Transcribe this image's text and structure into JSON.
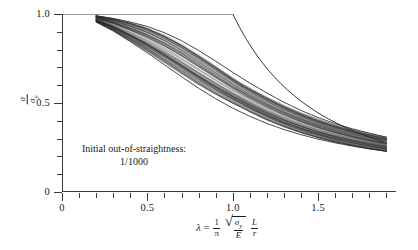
{
  "figure": {
    "background": "#ffffff",
    "axis_color": "#3a3a3a",
    "curve_color": "#2b2b2b",
    "annotation": {
      "line1": "Initial out-of-straightness:",
      "line2": "1/1000"
    },
    "ylabel_parts": {
      "numerator": "σ",
      "denominator": "σ",
      "denominator_sub": "y"
    },
    "xlabel_parts": {
      "lambda": "λ",
      "equals": "=",
      "one": "1",
      "pi": "π",
      "sigma_y": "σ",
      "sigma_y_sub": "y",
      "E": "E",
      "L": "L",
      "r": "r"
    }
  },
  "chart_data": {
    "type": "line",
    "title": "",
    "subtitle": "",
    "xlabel": "λ = (1/π)√(σ_y/E)(L/r)",
    "ylabel": "σ/σ_y",
    "xlim": [
      0,
      1.95
    ],
    "ylim": [
      0,
      1.0
    ],
    "grid": false,
    "legend": null,
    "annotations": [
      {
        "text": "Initial out-of-straightness: 1/1000",
        "x": 0.4,
        "y": 0.28
      }
    ],
    "xticks_major": [
      0,
      0.5,
      1.0,
      1.5
    ],
    "xticks_major_labels": [
      "0",
      "0.5",
      "1.0",
      "1.5"
    ],
    "xtick_minor_step": 0.1,
    "yticks_major": [
      0,
      0.5,
      1.0
    ],
    "yticks_major_labels": [
      "0",
      "0.5",
      "1.0"
    ],
    "ytick_minor_step": 0.1,
    "series": [
      {
        "name": "Euler / yield envelope",
        "role": "theoretical-upper-bound",
        "x": [
          0.0,
          0.2,
          0.4,
          0.6,
          0.8,
          1.0,
          1.1,
          1.2,
          1.3,
          1.4,
          1.5,
          1.6,
          1.7,
          1.8,
          1.9
        ],
        "values": [
          1.0,
          1.0,
          1.0,
          1.0,
          1.0,
          1.0,
          0.826,
          0.694,
          0.592,
          0.51,
          0.444,
          0.391,
          0.346,
          0.309,
          0.277
        ]
      },
      {
        "name": "upper bound column curve",
        "role": "band-upper",
        "x": [
          0.2,
          0.3,
          0.4,
          0.5,
          0.6,
          0.7,
          0.8,
          0.9,
          1.0,
          1.1,
          1.2,
          1.3,
          1.4,
          1.5,
          1.6,
          1.7,
          1.8,
          1.9
        ],
        "values": [
          0.99,
          0.975,
          0.955,
          0.93,
          0.895,
          0.85,
          0.795,
          0.735,
          0.672,
          0.612,
          0.556,
          0.504,
          0.458,
          0.418,
          0.384,
          0.355,
          0.33,
          0.308
        ]
      },
      {
        "name": "column curve band (upper-mid)",
        "role": "band",
        "x": [
          0.2,
          0.3,
          0.4,
          0.5,
          0.6,
          0.7,
          0.8,
          0.9,
          1.0,
          1.1,
          1.2,
          1.3,
          1.4,
          1.5,
          1.6,
          1.7,
          1.8,
          1.9
        ],
        "values": [
          0.985,
          0.962,
          0.932,
          0.896,
          0.852,
          0.8,
          0.742,
          0.681,
          0.62,
          0.562,
          0.51,
          0.463,
          0.422,
          0.387,
          0.357,
          0.331,
          0.309,
          0.29
        ]
      },
      {
        "name": "column curve band (mid)",
        "role": "band",
        "x": [
          0.2,
          0.3,
          0.4,
          0.5,
          0.6,
          0.7,
          0.8,
          0.9,
          1.0,
          1.1,
          1.2,
          1.3,
          1.4,
          1.5,
          1.6,
          1.7,
          1.8,
          1.9
        ],
        "values": [
          0.978,
          0.948,
          0.908,
          0.862,
          0.81,
          0.752,
          0.69,
          0.628,
          0.57,
          0.516,
          0.468,
          0.426,
          0.389,
          0.358,
          0.331,
          0.308,
          0.288,
          0.271
        ]
      },
      {
        "name": "column curve band (lower-mid)",
        "role": "band",
        "x": [
          0.2,
          0.3,
          0.4,
          0.5,
          0.6,
          0.7,
          0.8,
          0.9,
          1.0,
          1.1,
          1.2,
          1.3,
          1.4,
          1.5,
          1.6,
          1.7,
          1.8,
          1.9
        ],
        "values": [
          0.968,
          0.93,
          0.882,
          0.828,
          0.768,
          0.706,
          0.642,
          0.581,
          0.525,
          0.475,
          0.431,
          0.393,
          0.36,
          0.332,
          0.308,
          0.288,
          0.27,
          0.255
        ]
      },
      {
        "name": "lower bound column curve",
        "role": "band-lower",
        "x": [
          0.2,
          0.3,
          0.4,
          0.5,
          0.6,
          0.7,
          0.8,
          0.9,
          1.0,
          1.1,
          1.2,
          1.3,
          1.4,
          1.5,
          1.6,
          1.7,
          1.8,
          1.9
        ],
        "values": [
          0.955,
          0.905,
          0.845,
          0.782,
          0.715,
          0.648,
          0.583,
          0.524,
          0.471,
          0.425,
          0.385,
          0.351,
          0.322,
          0.297,
          0.276,
          0.258,
          0.242,
          0.229
        ]
      }
    ],
    "band_curve_count": 112
  }
}
